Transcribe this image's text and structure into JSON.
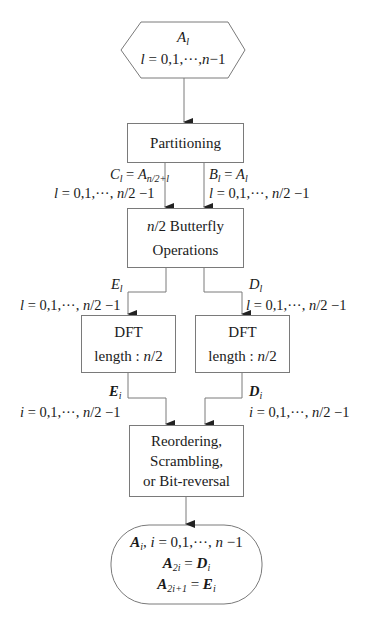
{
  "diagram": {
    "type": "flowchart",
    "title": "",
    "nodes": [
      {
        "id": "input",
        "shape": "hexagon",
        "lines": [
          "A_l",
          "l = 0,1,···,n−1"
        ]
      },
      {
        "id": "partitioning",
        "shape": "rectangle",
        "lines": [
          "Partitioning"
        ]
      },
      {
        "id": "butterfly",
        "shape": "rectangle",
        "lines": [
          "n/2 Butterfly",
          "Operations"
        ]
      },
      {
        "id": "dft_left",
        "shape": "rectangle",
        "lines": [
          "DFT",
          "length : n/2"
        ]
      },
      {
        "id": "dft_right",
        "shape": "rectangle",
        "lines": [
          "DFT",
          "length : n/2"
        ]
      },
      {
        "id": "reorder",
        "shape": "rectangle",
        "lines": [
          "Reordering,",
          "Scrambling,",
          "or Bit-reversal"
        ]
      },
      {
        "id": "output",
        "shape": "rounded-terminal",
        "lines": [
          "A_i, i = 0,1,···,n−1",
          "A_2i = D_i",
          "A_2i+1 = E_i"
        ]
      }
    ],
    "edges": [
      {
        "from": "input",
        "to": "partitioning",
        "label": ""
      },
      {
        "from": "partitioning",
        "to": "butterfly",
        "label": "C_l = A_n/2+l ; l = 0,1,···,n/2−1"
      },
      {
        "from": "partitioning",
        "to": "butterfly",
        "label": "B_l = A_l ; l = 0,1,···,n/2−1"
      },
      {
        "from": "butterfly",
        "to": "dft_left",
        "label": "E_l ; l = 0,1,···,n/2−1"
      },
      {
        "from": "butterfly",
        "to": "dft_right",
        "label": "D_l ; l = 0,1,···,n/2−1"
      },
      {
        "from": "dft_left",
        "to": "reorder",
        "label": "E_i ; i = 0,1,···,n/2−1"
      },
      {
        "from": "dft_right",
        "to": "reorder",
        "label": "D_i ; i = 0,1,···,n/2−1"
      },
      {
        "from": "reorder",
        "to": "output",
        "label": ""
      }
    ]
  },
  "input": {
    "var": "A",
    "sub": "l",
    "range_var": "l",
    "range": " = 0,1,···,",
    "range_n": "n",
    "range_end": "−1"
  },
  "partitioning": {
    "label": "Partitioning"
  },
  "edge_c": {
    "var": "C",
    "sub": "l",
    "eq": " = ",
    "var2": "A",
    "sub2": "n/2+l",
    "range_var": "l",
    "range": " = 0,1,···, ",
    "range_n": "n",
    "range_end": "/2 −1"
  },
  "edge_b": {
    "var": "B",
    "sub": "l",
    "eq": " = ",
    "var2": "A",
    "sub2": "l",
    "range_var": "l",
    "range": " = 0,1,···, ",
    "range_n": "n",
    "range_end": "/2 −1"
  },
  "butterfly": {
    "n": "n",
    "line1_rest": "/2 Butterfly",
    "line2": "Operations"
  },
  "edge_e": {
    "var": "E",
    "sub": "l",
    "range_var": "l",
    "range": " = 0,1,···, ",
    "range_n": "n",
    "range_end": "/2 −1"
  },
  "edge_d": {
    "var": "D",
    "sub": "l",
    "range_var": "l",
    "range": " = 0,1,···, ",
    "range_n": "n",
    "range_end": "/2 −1"
  },
  "dft_left": {
    "line1": "DFT",
    "line2_prefix": "length : ",
    "n": "n",
    "line2_suffix": "/2"
  },
  "dft_right": {
    "line1": "DFT",
    "line2_prefix": "length : ",
    "n": "n",
    "line2_suffix": "/2"
  },
  "edge_ei": {
    "var": "E",
    "sub": "i",
    "range_var": "i",
    "range": " = 0,1,···, ",
    "range_n": "n",
    "range_end": "/2 −1"
  },
  "edge_di": {
    "var": "D",
    "sub": "i",
    "range_var": "i",
    "range": " = 0,1,···, ",
    "range_n": "n",
    "range_end": "/2 −1"
  },
  "reorder": {
    "line1": "Reordering,",
    "line2": "Scrambling,",
    "line3": "or Bit-reversal"
  },
  "output": {
    "l1_var": "A",
    "l1_sub": "i",
    "l1_sep": ", ",
    "l1_ivar": "i",
    "l1_range": " = 0,1,···, ",
    "l1_n": "n",
    "l1_end": " −1",
    "l2_var": "A",
    "l2_sub": "2i",
    "l2_eq": " = ",
    "l2_var2": "D",
    "l2_sub2": "i",
    "l3_var": "A",
    "l3_sub": "2i+1",
    "l3_eq": " = ",
    "l3_var2": "E",
    "l3_sub2": "i"
  },
  "colors": {
    "stroke": "#7a7a7a",
    "arrow": "#222222",
    "text": "#1a1a1a",
    "background": "#ffffff"
  }
}
